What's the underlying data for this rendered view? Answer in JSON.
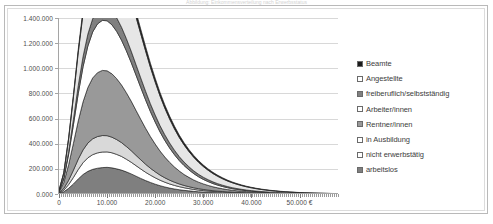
{
  "title_remnant": "Abbildung: Einkommensverteilung nach Erwerbsstatus",
  "chart_data": {
    "type": "area",
    "stacked": true,
    "title": "",
    "subtitle": "",
    "xlabel": "",
    "ylabel": "",
    "xlim": [
      0,
      58000
    ],
    "ylim": [
      0,
      1400000
    ],
    "grid": true,
    "legend_position": "right",
    "x_tick_labels": [
      "0",
      "10.000",
      "20.000",
      "30.000",
      "40.000",
      "50.000 €"
    ],
    "x_tick_values": [
      0,
      10000,
      20000,
      30000,
      40000,
      50000
    ],
    "y_tick_labels": [
      "0.000",
      "200.000",
      "400.000",
      "600.000",
      "800.000",
      "1.000.000",
      "1.200.000",
      "1.400.000"
    ],
    "y_tick_values": [
      0,
      200000,
      400000,
      600000,
      800000,
      1000000,
      1200000,
      1400000
    ],
    "x": [
      0,
      1000,
      2000,
      3000,
      4000,
      5000,
      6000,
      7000,
      8000,
      9000,
      10000,
      11000,
      12000,
      13000,
      14000,
      15000,
      16000,
      17000,
      18000,
      19000,
      20000,
      21000,
      22000,
      23000,
      24000,
      25000,
      26000,
      27000,
      28000,
      29000,
      30000,
      31000,
      32000,
      33000,
      34000,
      35000,
      36000,
      37000,
      38000,
      39000,
      40000,
      41000,
      42000,
      43000,
      44000,
      45000,
      46000,
      47000,
      48000,
      49000,
      50000,
      51000,
      52000,
      53000,
      54000,
      55000,
      56000,
      57000,
      58000
    ],
    "series": [
      {
        "name": "arbeitslos",
        "color": "#7f7f7f",
        "values": [
          3000,
          18000,
          45000,
          80000,
          120000,
          155000,
          180000,
          196000,
          205000,
          210000,
          212000,
          208000,
          200000,
          190000,
          176000,
          160000,
          142000,
          124000,
          107000,
          92000,
          78000,
          66000,
          56000,
          47000,
          40000,
          34000,
          29000,
          25000,
          21000,
          18000,
          15500,
          13500,
          11500,
          10000,
          8700,
          7500,
          6500,
          5700,
          5000,
          4400,
          3900,
          3400,
          3000,
          2700,
          2400,
          2100,
          1900,
          1700,
          1500,
          1350,
          1200,
          1080,
          960,
          860,
          770,
          690,
          620,
          550,
          490
        ]
      },
      {
        "name": "nicht erwerbstätig",
        "color": "#ffffff",
        "values": [
          2000,
          12000,
          30000,
          52000,
          75000,
          94000,
          108000,
          117000,
          122000,
          124000,
          123000,
          120000,
          115000,
          109000,
          101000,
          93000,
          84000,
          75000,
          66000,
          58000,
          51000,
          44000,
          38000,
          33000,
          28500,
          24500,
          21000,
          18000,
          15500,
          13300,
          11400,
          9800,
          8400,
          7200,
          6200,
          5300,
          4600,
          4000,
          3500,
          3000,
          2600,
          2300,
          2000,
          1750,
          1550,
          1350,
          1200,
          1050,
          930,
          820,
          730,
          650,
          570,
          510,
          450,
          400,
          360,
          320,
          280
        ]
      },
      {
        "name": "in Ausbildung",
        "color": "#d9d9d9",
        "values": [
          2500,
          14000,
          34000,
          58000,
          82000,
          102000,
          117000,
          126000,
          130000,
          131000,
          129000,
          124000,
          118000,
          110000,
          101000,
          92000,
          82000,
          73000,
          64000,
          55000,
          48000,
          41000,
          35000,
          30000,
          25500,
          21500,
          18200,
          15400,
          13000,
          11000,
          9300,
          7900,
          6700,
          5700,
          4800,
          4100,
          3500,
          3000,
          2600,
          2200,
          1900,
          1650,
          1420,
          1230,
          1060,
          920,
          800,
          690,
          600,
          520,
          450,
          390,
          340,
          300,
          260,
          230,
          200,
          175,
          150
        ]
      },
      {
        "name": "Rentner/innen",
        "color": "#999999",
        "values": [
          8000,
          48000,
          124000,
          214000,
          304000,
          382000,
          442000,
          484000,
          508000,
          518000,
          516000,
          504000,
          484000,
          458000,
          428000,
          394000,
          358000,
          322000,
          286000,
          252000,
          220000,
          191000,
          165000,
          142000,
          121000,
          103000,
          87000,
          74000,
          62000,
          52000,
          44000,
          37000,
          31000,
          26000,
          22000,
          18500,
          15500,
          13000,
          11000,
          9200,
          7800,
          6600,
          5600,
          4700,
          4000,
          3400,
          2900,
          2450,
          2080,
          1760,
          1500,
          1270,
          1080,
          910,
          780,
          660,
          560,
          480,
          400
        ]
      },
      {
        "name": "Arbeiter/innen",
        "color": "#ffffff",
        "values": [
          5000,
          30000,
          82000,
          148000,
          218000,
          280000,
          330000,
          366000,
          388000,
          398000,
          398000,
          390000,
          376000,
          357000,
          334000,
          308000,
          281000,
          253000,
          226000,
          199000,
          175000,
          152000,
          132000,
          114000,
          98000,
          83000,
          71000,
          60000,
          51000,
          43000,
          36000,
          30500,
          25500,
          21500,
          18000,
          15000,
          12600,
          10500,
          8800,
          7300,
          6100,
          5100,
          4250,
          3550,
          2950,
          2450,
          2050,
          1700,
          1420,
          1180,
          980,
          810,
          680,
          560,
          470,
          390,
          320,
          270,
          220
        ]
      },
      {
        "name": "freiberuflich/selbstständig",
        "color": "#808080",
        "values": [
          1500,
          9000,
          24000,
          43000,
          63000,
          81000,
          95000,
          105000,
          111000,
          114000,
          114000,
          112000,
          108000,
          103000,
          97000,
          90000,
          83000,
          76000,
          69000,
          62000,
          56000,
          50000,
          45000,
          40000,
          35500,
          31500,
          28000,
          24800,
          22000,
          19500,
          17200,
          15200,
          13400,
          11800,
          10400,
          9100,
          8000,
          7000,
          6150,
          5400,
          4700,
          4100,
          3600,
          3150,
          2750,
          2400,
          2100,
          1830,
          1600,
          1400,
          1220,
          1060,
          920,
          800,
          700,
          610,
          530,
          460,
          400
        ]
      },
      {
        "name": "Angestellte",
        "color": "#e6e6e6",
        "values": [
          6000,
          36000,
          98000,
          178000,
          264000,
          342000,
          406000,
          452000,
          482000,
          498000,
          502000,
          496000,
          482000,
          462000,
          438000,
          410000,
          380000,
          350000,
          320000,
          290000,
          262000,
          236000,
          212000,
          190000,
          170000,
          152000,
          136000,
          121000,
          108000,
          96000,
          85000,
          75000,
          66000,
          58000,
          51000,
          44500,
          39000,
          34000,
          29500,
          25500,
          22000,
          19000,
          16400,
          14100,
          12100,
          10400,
          8900,
          7600,
          6500,
          5500,
          4700,
          3980,
          3370,
          2840,
          2390,
          2010,
          1690,
          1410,
          1180
        ]
      },
      {
        "name": "Beamte",
        "color": "#1a1a1a",
        "values": [
          600,
          3600,
          9000,
          16000,
          24000,
          31000,
          37000,
          41500,
          44500,
          46500,
          47500,
          47500,
          47000,
          46000,
          44500,
          42500,
          40500,
          38000,
          35500,
          33000,
          30500,
          28000,
          25500,
          23500,
          21500,
          19500,
          17800,
          16200,
          14700,
          13300,
          12000,
          10800,
          9700,
          8700,
          7800,
          7000,
          6250,
          5600,
          5000,
          4450,
          3950,
          3500,
          3100,
          2740,
          2420,
          2130,
          1880,
          1650,
          1450,
          1270,
          1110,
          970,
          840,
          730,
          640,
          550,
          480,
          410,
          350
        ]
      }
    ],
    "legend_entries": [
      {
        "label": "Beamte",
        "color": "#1a1a1a",
        "swatch": "filled-dark"
      },
      {
        "label": "Angestellte",
        "color": "#ffffff",
        "swatch": "outline-white"
      },
      {
        "label": "freiberuflich/selbstständig",
        "color": "#808080",
        "swatch": "filled-gray"
      },
      {
        "label": "Arbeiter/innen",
        "color": "#ffffff",
        "swatch": "outline-white"
      },
      {
        "label": "Rentner/innen",
        "color": "#999999",
        "swatch": "filled-gray"
      },
      {
        "label": "in Ausbildung",
        "color": "#ffffff",
        "swatch": "outline-white"
      },
      {
        "label": "nicht erwerbstätig",
        "color": "#ffffff",
        "swatch": "outline-white"
      },
      {
        "label": "arbeitslos",
        "color": "#7f7f7f",
        "swatch": "filled-gray"
      }
    ]
  }
}
